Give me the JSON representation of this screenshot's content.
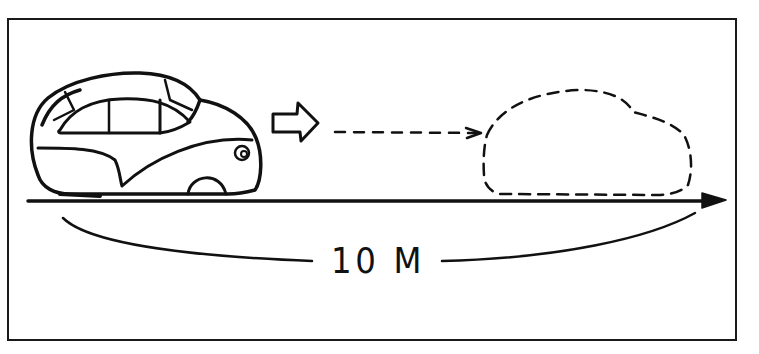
{
  "diagram": {
    "distance_label": "10 M",
    "elements": [
      {
        "name": "car",
        "description": "solid-outline rounded car on the left"
      },
      {
        "name": "motion-arrow",
        "description": "hollow block arrow pointing right"
      },
      {
        "name": "dashed-path-arrow",
        "description": "dashed arrow from car toward ghost car"
      },
      {
        "name": "ghost-car",
        "description": "dashed-outline car at destination"
      },
      {
        "name": "ground-line",
        "description": "solid ground line ending in an arrowhead"
      },
      {
        "name": "distance-bracket",
        "description": "curved bracket under ground line with distance label"
      }
    ],
    "colors": {
      "ink": "#111111",
      "background": "#ffffff",
      "frame": "#1a1a1a"
    }
  }
}
